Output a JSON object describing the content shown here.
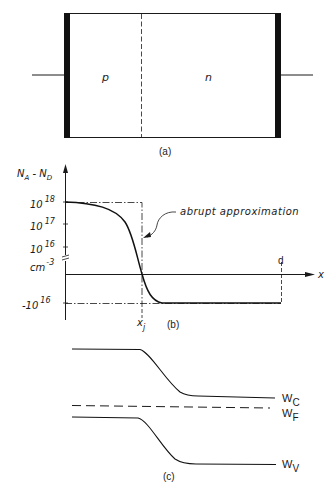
{
  "panel_a": {
    "caption": "(a)",
    "region_p": "p",
    "region_n": "n"
  },
  "panel_b": {
    "caption": "(b)",
    "y_axis_label_main": "N",
    "y_axis_label_sub_a": "A",
    "y_axis_label_dash": " - N",
    "y_axis_label_sub_d": "D",
    "ticks": [
      {
        "base": "10",
        "exp": "18"
      },
      {
        "base": "10",
        "exp": "17"
      },
      {
        "base": "10",
        "exp": "16"
      },
      {
        "base": "cm",
        "exp": "-3"
      },
      {
        "base": "-10",
        "exp": "16"
      }
    ],
    "x_axis_label": "x",
    "junction_label": "x",
    "junction_sub": "j",
    "d_label": "d",
    "annotation": "abrupt approximation"
  },
  "panel_c": {
    "caption": "(c)",
    "wc": {
      "base": "W",
      "sub": "C"
    },
    "wf": {
      "base": "W",
      "sub": "F"
    },
    "wv": {
      "base": "W",
      "sub": "V"
    }
  },
  "colors": {
    "ink": "#1a1a1a",
    "background": "#ffffff"
  }
}
